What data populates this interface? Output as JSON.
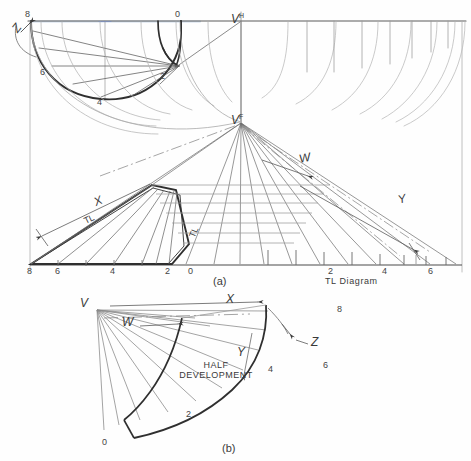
{
  "figure": {
    "title_caption_a": "(a)",
    "title_caption_b": "(b)",
    "tl_diagram_label": "TL Diagram",
    "half_development_line1": "HALF",
    "half_development_line2": "DEVELOPMENT",
    "ink_color": "#2f2f2f",
    "construction_color": "#8e8e8e",
    "light_color": "#b4b4b4",
    "paper_color": "#fefefe",
    "blue_tint": "#9fb9d6"
  },
  "top_view": {
    "apex_label": "V",
    "apex_superscript": "H",
    "center_mark": "+",
    "rotation_label": "Z",
    "station_labels": [
      "8",
      "6",
      "4",
      "2",
      "0"
    ]
  },
  "front_view": {
    "apex_label": "V",
    "apex_superscript": "F",
    "edge_label_x": "X",
    "edge_label_w": "W",
    "edge_label_y": "Y",
    "true_length_left": "TL",
    "true_length_right": "TL",
    "baseline_labels": [
      "8",
      "6",
      "4",
      "2",
      "0"
    ],
    "tl_baseline_labels": [
      "2",
      "4",
      "6"
    ]
  },
  "development": {
    "apex_label": "V",
    "edge_label_x": "X",
    "edge_label_w": "W",
    "edge_label_y": "Y",
    "edge_label_z": "Z",
    "station_labels": [
      "0",
      "2",
      "4",
      "6",
      "8"
    ]
  }
}
